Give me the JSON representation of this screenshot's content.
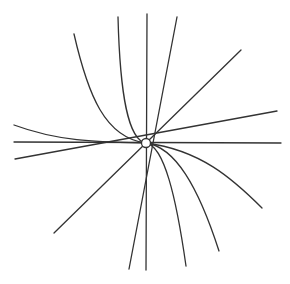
{
  "figure": {
    "title": "",
    "line_color": "#333333",
    "background": "#ffffff",
    "center": {
      "x": 146,
      "y": 143,
      "r": 4.5
    },
    "straight_lines": [
      {
        "name": "vertical",
        "x1": 147,
        "y1": 14,
        "x2": 146,
        "y2": 270
      },
      {
        "name": "horizontal",
        "x1": 14,
        "y1": 142,
        "x2": 281,
        "y2": 143
      },
      {
        "name": "steep-right",
        "x1": 177,
        "y1": 17,
        "x2": 129,
        "y2": 269
      },
      {
        "name": "diagonal",
        "x1": 241,
        "y1": 50,
        "x2": 54,
        "y2": 233
      },
      {
        "name": "shallow",
        "x1": 277,
        "y1": 111,
        "x2": 15,
        "y2": 159
      }
    ],
    "curves": [
      {
        "name": "curve-upper-left-outer",
        "d": "M74,34 C88,95 105,138 146,143"
      },
      {
        "name": "curve-upper-left-inner",
        "d": "M118,17 C120,95 128,140 146,143"
      },
      {
        "name": "curve-left-tangent",
        "d": "M14,125 C60,142 100,142 146,143"
      },
      {
        "name": "curve-lower-right-outer",
        "d": "M262,208 C232,178 200,150 146,143"
      },
      {
        "name": "curve-lower-right-mid",
        "d": "M219,251 C198,186 175,147 146,143"
      },
      {
        "name": "curve-lower-right-inner",
        "d": "M186,266 C176,196 164,146 146,143"
      }
    ]
  }
}
